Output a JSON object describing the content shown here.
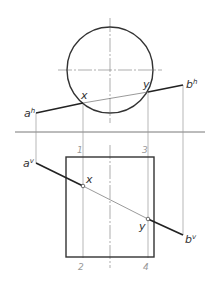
{
  "diagram": {
    "type": "orthographic-projection",
    "colors": {
      "outline": "#333333",
      "thin": "#555555",
      "construction": "#9a9a9a",
      "center": "#777777",
      "background": "#ffffff"
    },
    "reference_line": {
      "x1": 15,
      "y": 132,
      "x2": 205
    },
    "top_view": {
      "circle": {
        "cx": 110,
        "cy": 70,
        "r": 43
      },
      "centerline_v": {
        "x": 110,
        "y1": 18,
        "y2": 123
      },
      "centerline_h": {
        "y": 70,
        "x1": 58,
        "x2": 162
      },
      "line": {
        "start": {
          "x": 36,
          "y": 113,
          "label": "a",
          "sup": "h"
        },
        "end": {
          "x": 183,
          "y": 85,
          "label": "b",
          "sup": "h"
        },
        "x_point": {
          "x": 83,
          "y": 103,
          "label": "x"
        },
        "y_point": {
          "x": 148,
          "y": 92,
          "label": "y"
        }
      }
    },
    "front_view": {
      "rectangle": {
        "x": 66,
        "y": 157,
        "width": 88,
        "height": 100
      },
      "centerline_v": {
        "x": 110,
        "y1": 145,
        "y2": 268
      },
      "line": {
        "start": {
          "x": 36,
          "y": 163,
          "label": "a",
          "sup": "v"
        },
        "end": {
          "x": 183,
          "y": 235,
          "label": "b",
          "sup": "v"
        },
        "x_point": {
          "x": 83,
          "y": 186,
          "label": "x"
        },
        "y_point": {
          "x": 148,
          "y": 219,
          "label": "y"
        }
      }
    },
    "projection_numbers": [
      {
        "label": "1",
        "x": 77,
        "y": 153
      },
      {
        "label": "3",
        "x": 142,
        "y": 153
      },
      {
        "label": "2",
        "x": 78,
        "y": 270
      },
      {
        "label": "4",
        "x": 143,
        "y": 270
      }
    ]
  }
}
